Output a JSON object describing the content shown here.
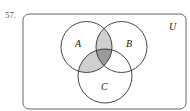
{
  "problem": {
    "number": "57."
  },
  "diagram": {
    "universe_label": "U",
    "sets": [
      {
        "label": "A",
        "cx": 86.5,
        "cy": 47,
        "r": 25.5
      },
      {
        "label": "B",
        "cx": 121.5,
        "cy": 47,
        "r": 25.5
      },
      {
        "label": "C",
        "cx": 105,
        "cy": 76,
        "r": 27
      }
    ],
    "shaded_regions": [
      {
        "region": "A∩B only",
        "color": "#cfcfcf"
      },
      {
        "region": "A∩C only",
        "color": "#cfcfcf"
      },
      {
        "region": "A∩B∩C",
        "color": "#9a9a9a"
      }
    ],
    "stroke_color": "#333333"
  }
}
